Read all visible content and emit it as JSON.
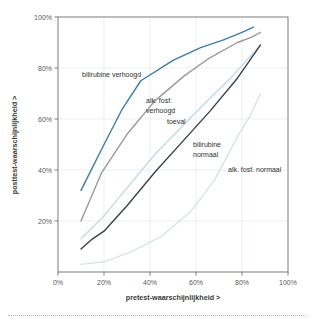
{
  "figure": {
    "clipped_header_text": "",
    "background_color": "#ffffff"
  },
  "chart_data": {
    "type": "line",
    "title": "",
    "subtitle": "",
    "xlabel": "pretest-waarschijnlijkheid >",
    "ylabel": "posttest-waarschijnlijkheid >",
    "xlim": [
      0,
      100
    ],
    "ylim": [
      0,
      100
    ],
    "x_ticks": [
      0,
      20,
      40,
      60,
      80,
      100
    ],
    "x_tick_labels": [
      "0%",
      "20%",
      "40%",
      "60%",
      "80%",
      "100%"
    ],
    "y_ticks": [
      20,
      40,
      60,
      80,
      100
    ],
    "y_tick_labels": [
      "20%",
      "40%",
      "60%",
      "80%",
      "100%"
    ],
    "grid": true,
    "legend_position": "inline-annotations",
    "series": [
      {
        "name": "bilirubine verhoogd",
        "color": "#3b7ea8",
        "x": [
          10,
          20,
          28,
          36,
          50,
          62,
          72,
          80,
          85
        ],
        "y": [
          32,
          50,
          64,
          75,
          83,
          88,
          91,
          94,
          96
        ]
      },
      {
        "name": "alk. fosf. verhoogd",
        "color": "#9a9a9a",
        "x": [
          10,
          19,
          30,
          42,
          55,
          66,
          78,
          84,
          88
        ],
        "y": [
          20,
          39,
          54,
          67,
          77,
          84,
          90,
          92,
          94
        ]
      },
      {
        "name": "toeval",
        "color": "#c5d9e6",
        "x": [
          10,
          20,
          30,
          42,
          55,
          66,
          76,
          84,
          88
        ],
        "y": [
          13,
          22,
          33,
          46,
          58,
          68,
          77,
          85,
          89
        ]
      },
      {
        "name": "bilirubine normaal",
        "color": "#3c4148",
        "x": [
          10,
          15,
          20,
          30,
          42,
          55,
          66,
          78,
          88
        ],
        "y": [
          9,
          13,
          16,
          26,
          39,
          52,
          63,
          76,
          89
        ]
      },
      {
        "name": "alk. fosf. normaal",
        "color": "#d8e4ea",
        "x": [
          10,
          20,
          32,
          45,
          58,
          68,
          78,
          84,
          88
        ],
        "y": [
          3,
          4,
          8,
          14,
          24,
          36,
          53,
          62,
          70
        ]
      }
    ],
    "annotations": [
      {
        "label": "bilirubine verhoogd",
        "x_px": 82,
        "y_px": 77,
        "anchor": "start",
        "lines": [
          "bilirubine verhoogd"
        ]
      },
      {
        "label": "alk. fosf. verhoogd",
        "x_px": 146,
        "y_px": 103,
        "anchor": "start",
        "lines": [
          "alk. fosf.",
          "verhoogd"
        ]
      },
      {
        "label": "toeval",
        "x_px": 167,
        "y_px": 124,
        "anchor": "start",
        "lines": [
          "toeval"
        ]
      },
      {
        "label": "bilirubine normaal",
        "x_px": 193,
        "y_px": 147,
        "anchor": "start",
        "lines": [
          "bilirubine",
          "normaal"
        ]
      },
      {
        "label": "alk. fosf. normaal",
        "x_px": 228,
        "y_px": 172,
        "anchor": "start",
        "lines": [
          "alk. fosf. normaal"
        ]
      }
    ]
  }
}
